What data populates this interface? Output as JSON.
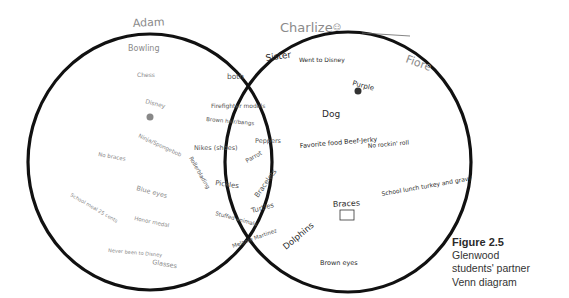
{
  "diagram": {
    "type": "venn",
    "left_set": {
      "label": "Adam",
      "items": [
        "Bowling",
        "Chess",
        "Disney",
        "Ninja/Spongebob",
        "No braces",
        "Blue eyes",
        "School meal 25 cents",
        "Honor medal",
        "Never been to Disney",
        "Glasses"
      ]
    },
    "right_set": {
      "label": "Charlize",
      "secondary_label": "Fiore",
      "items": [
        "Sister",
        "Went to Disney",
        "Purple",
        "Dog",
        "Favorite food Beef-Jerky",
        "No rockin' roll",
        "School lunch turkey and gravy",
        "Braces",
        "Dolphins",
        "Brown eyes"
      ]
    },
    "intersection": {
      "label": "both",
      "items": [
        "Firefighter models",
        "Brown hair/bangs",
        "Nikes (shoes)",
        "Peppers",
        "Parrot",
        "Rollerblading",
        "Pickles",
        "Bracelets",
        "Turtles",
        "Stuffed animals",
        "Melanie Martinez"
      ]
    }
  },
  "caption": {
    "figure": "Figure 2.5",
    "line1": "Glenwood",
    "line2": "students' partner",
    "line3": "Venn diagram"
  },
  "colors": {
    "outline": "#111111",
    "pencil_light": "#8a8a8a",
    "pencil_dark": "#2a2a2a",
    "caption_text": "#333333"
  }
}
